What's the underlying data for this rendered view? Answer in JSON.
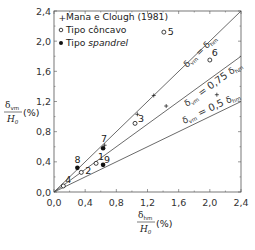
{
  "chart_data": {
    "type": "scatter",
    "title": "",
    "xlabel": "δhm / H0 (%)",
    "ylabel": "δvm / H0 (%)",
    "xlim": [
      0,
      2.4
    ],
    "ylim": [
      0,
      2.4
    ],
    "x_ticks": [
      "0,0",
      "0,4",
      "0,8",
      "1,2",
      "1,6",
      "2,0",
      "2,4"
    ],
    "y_ticks": [
      "0,0",
      "0,4",
      "0,8",
      "1,2",
      "1,6",
      "2,0",
      "2,4"
    ],
    "grid": false,
    "legend_position": "upper-left",
    "legend": [
      {
        "marker": "plus",
        "label": "Mana e Clough (1981)"
      },
      {
        "marker": "open-circle",
        "label": "Tipo côncavo"
      },
      {
        "marker": "filled-circle",
        "label_prefix": "Tipo ",
        "label_italic": "spandrel"
      }
    ],
    "reference_lines": [
      {
        "label": "δvm = δhm",
        "slope": 1.0
      },
      {
        "label": "δvm = 0,75 δhm",
        "slope": 0.75
      },
      {
        "label": "δvm = 0,5 δhm",
        "slope": 0.5
      }
    ],
    "series": [
      {
        "name": "Mana e Clough (1981)",
        "marker": "plus",
        "points": [
          {
            "x": 0.65,
            "y": 0.62
          },
          {
            "x": 1.07,
            "y": 1.03
          },
          {
            "x": 1.28,
            "y": 1.28
          },
          {
            "x": 1.44,
            "y": 1.14
          },
          {
            "x": 2.09,
            "y": 1.29
          }
        ]
      },
      {
        "name": "Tipo côncavo",
        "marker": "open-circle",
        "points": [
          {
            "label": "1",
            "x": 0.54,
            "y": 0.38
          },
          {
            "label": "2",
            "x": 0.35,
            "y": 0.26
          },
          {
            "label": "3",
            "x": 1.04,
            "y": 0.91
          },
          {
            "label": "4",
            "x": 0.12,
            "y": 0.08
          },
          {
            "label": "5",
            "x": 1.41,
            "y": 2.12
          },
          {
            "label": "6",
            "x": 2.0,
            "y": 1.75
          }
        ]
      },
      {
        "name": "Tipo spandrel",
        "marker": "filled-circle",
        "points": [
          {
            "label": "7",
            "x": 0.63,
            "y": 0.58
          },
          {
            "label": "8",
            "x": 0.3,
            "y": 0.32
          },
          {
            "label": "9",
            "x": 0.63,
            "y": 0.36
          }
        ]
      }
    ]
  },
  "axis_labels": {
    "y_num": "δ",
    "y_num_sub": "vm",
    "y_den": "H",
    "y_den_sub": "0",
    "y_unit": "(%)",
    "x_num": "δ",
    "x_num_sub": "hm",
    "x_den": "H",
    "x_den_sub": "0",
    "x_unit": "(%)"
  },
  "line_labels": {
    "l1_a": "δ",
    "l1_a_sub": "vm",
    "l1_eq": " = ",
    "l1_b": "δ",
    "l1_b_sub": "hm",
    "l2_a": "δ",
    "l2_a_sub": "vm",
    "l2_eq": " = 0,75 ",
    "l2_b": "δ",
    "l2_b_sub": "hm",
    "l3_a": "δ",
    "l3_a_sub": "vm",
    "l3_eq": " = 0,5 ",
    "l3_b": "δ",
    "l3_b_sub": "hm"
  },
  "colors": {
    "axis": "#555555",
    "line": "#444444",
    "marker": "#111111"
  }
}
